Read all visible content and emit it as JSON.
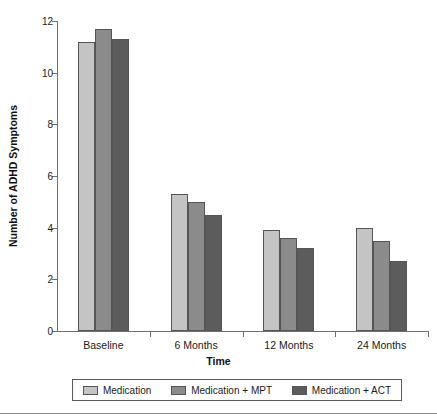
{
  "chart_data": {
    "type": "bar",
    "title": "",
    "xlabel": "Time",
    "ylabel": "Number of ADHD Symptoms",
    "categories": [
      "Baseline",
      "6 Months",
      "12 Months",
      "24 Months"
    ],
    "series": [
      {
        "name": "Medication",
        "values": [
          11.2,
          5.3,
          3.9,
          4.0
        ],
        "color": "#c4c4c4"
      },
      {
        "name": "Medication + MPT",
        "values": [
          11.7,
          5.0,
          3.6,
          3.5
        ],
        "color": "#8b8b8b"
      },
      {
        "name": "Medication + ACT",
        "values": [
          11.3,
          4.5,
          3.2,
          2.7
        ],
        "color": "#5c5c5c"
      }
    ],
    "ylim": [
      0,
      12
    ],
    "yticks": [
      0,
      2,
      4,
      6,
      8,
      10,
      12
    ],
    "ytick_labels": [
      "0",
      "2",
      "4",
      "6",
      "8",
      "10",
      "12"
    ],
    "grid": false,
    "legend_position": "bottom"
  },
  "legend": {
    "items": [
      {
        "label": "Medication"
      },
      {
        "label": "Medication + MPT"
      },
      {
        "label": "Medication + ACT"
      }
    ]
  }
}
